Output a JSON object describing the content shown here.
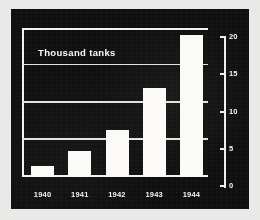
{
  "figure": {
    "panel_background": "#0d0c0c",
    "ink_color": "#fbfaf6",
    "page_background": "#e9e9e7"
  },
  "chart_data": {
    "type": "bar",
    "title": "Thousand tanks",
    "subtitle": "",
    "xlabel": "",
    "ylabel": "",
    "categories": [
      "1940",
      "1941",
      "1942",
      "1943",
      "1944"
    ],
    "values": [
      1.5,
      3.5,
      6.3,
      12.0,
      19.0
    ],
    "ylim": [
      0,
      20
    ],
    "yticks": [
      0,
      5,
      10,
      15,
      20
    ],
    "ytick_labels": [
      "0",
      "5",
      "10",
      "15",
      "20"
    ],
    "grid": true,
    "grid_axis": "y",
    "legend": false,
    "legend_position": "none",
    "axis_position": "right",
    "series": [
      {
        "name": "Thousand tanks",
        "values": [
          1.5,
          3.5,
          6.3,
          12.0,
          19.0
        ],
        "color": "#fbfaf6"
      }
    ]
  }
}
